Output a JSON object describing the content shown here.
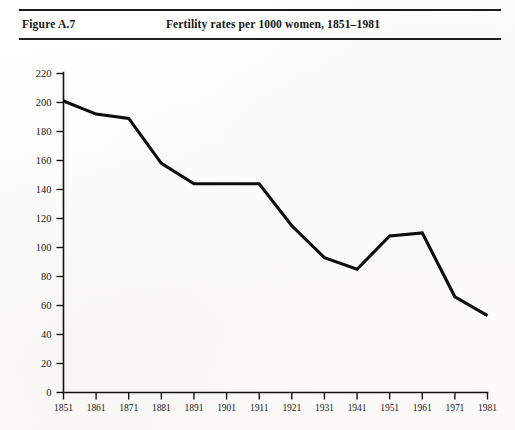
{
  "header": {
    "figure_label": "Figure A.7",
    "title": "Fertility rates per 1000 women, 1851–1981"
  },
  "colors": {
    "ink": "#131313",
    "line": "#0d0d0d",
    "paper": "#fdfdfb"
  },
  "chart_data": {
    "type": "line",
    "title": "Fertility rates per 1000 women, 1851–1981",
    "xlabel": "",
    "ylabel": "",
    "categories": [
      "1851",
      "1861",
      "1871",
      "1881",
      "1891",
      "1901",
      "1911",
      "1921",
      "1931",
      "1941",
      "1951",
      "1961",
      "1971",
      "1981"
    ],
    "values": [
      201,
      192,
      189,
      158,
      144,
      144,
      144,
      115,
      93,
      85,
      108,
      110,
      66,
      53
    ],
    "series": [
      {
        "name": "Fertility rate per 1000 women",
        "values": [
          201,
          192,
          189,
          158,
          144,
          144,
          144,
          115,
          93,
          85,
          108,
          110,
          66,
          53
        ]
      }
    ],
    "ylim": [
      0,
      220
    ],
    "ytick_step": 20,
    "yticks": [
      0,
      20,
      40,
      60,
      80,
      100,
      120,
      140,
      160,
      180,
      200,
      220
    ],
    "xticks": [
      "1851",
      "1861",
      "1871",
      "1881",
      "1891",
      "1901",
      "1911",
      "1921",
      "1931",
      "1941",
      "1951",
      "1961",
      "1971",
      "1981"
    ],
    "grid": false,
    "legend": null,
    "legend_position": "none",
    "annotations": []
  }
}
